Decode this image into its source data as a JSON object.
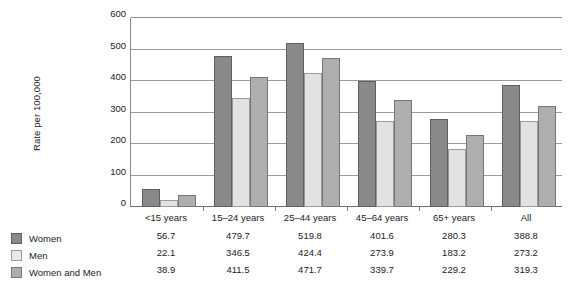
{
  "chart_data": {
    "type": "bar",
    "title": "",
    "xlabel": "",
    "ylabel": "Rate per 100,000",
    "ylim": [
      0,
      600
    ],
    "yticks": [
      0,
      100,
      200,
      300,
      400,
      500,
      600
    ],
    "grid": true,
    "legend_position": "bottom-left",
    "categories": [
      "<15 years",
      "15–24 years",
      "25–44 years",
      "45–64 years",
      "65+ years",
      "All"
    ],
    "series": [
      {
        "name": "Women",
        "color": "#8a8a8a",
        "values": [
          56.7,
          479.7,
          519.8,
          401.6,
          280.3,
          388.8
        ]
      },
      {
        "name": "Men",
        "color": "#e2e2e2",
        "values": [
          22.1,
          346.5,
          424.4,
          273.9,
          183.2,
          273.2
        ]
      },
      {
        "name": "Women and Men",
        "color": "#aeaeae",
        "values": [
          38.9,
          411.5,
          471.7,
          339.7,
          229.2,
          319.3
        ]
      }
    ],
    "data_table": {
      "rows": [
        {
          "label": "Women",
          "values": [
            "56.7",
            "479.7",
            "519.8",
            "401.6",
            "280.3",
            "388.8"
          ]
        },
        {
          "label": "Men",
          "values": [
            "22.1",
            "346.5",
            "424.4",
            "273.9",
            "183.2",
            "273.2"
          ]
        },
        {
          "label": "Women and Men",
          "values": [
            "38.9",
            "411.5",
            "471.7",
            "339.7",
            "229.2",
            "319.3"
          ]
        }
      ]
    }
  }
}
